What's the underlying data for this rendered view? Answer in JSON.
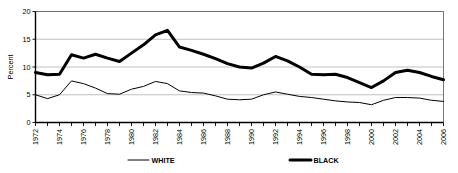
{
  "chart_data": {
    "type": "line",
    "title": "",
    "xlabel": "",
    "ylabel": "Percent",
    "ylim": [
      0,
      20
    ],
    "yticks": [
      0,
      5,
      10,
      15,
      20
    ],
    "xlim": [
      1972,
      2006
    ],
    "grid": true,
    "legend_position": "bottom",
    "x": [
      1972,
      1973,
      1974,
      1975,
      1976,
      1977,
      1978,
      1979,
      1980,
      1981,
      1982,
      1983,
      1984,
      1985,
      1986,
      1987,
      1988,
      1989,
      1990,
      1991,
      1992,
      1993,
      1994,
      1995,
      1996,
      1997,
      1998,
      1999,
      2000,
      2001,
      2002,
      2003,
      2004,
      2005,
      2006
    ],
    "xtick_labels": [
      "1972",
      "1973",
      "1974",
      "1975",
      "1976",
      "1977",
      "1978",
      "1979",
      "1980",
      "1981",
      "1982",
      "1983",
      "1984",
      "1985",
      "1986",
      "1987",
      "1988",
      "1989",
      "1990",
      "1991",
      "1992",
      "1993",
      "1994",
      "1995",
      "1996",
      "1997",
      "1998",
      "1999",
      "2000",
      "2001",
      "2002",
      "2003",
      "2004",
      "2005",
      "2006"
    ],
    "xtick_labels_shown": [
      "1972",
      "1974",
      "1976",
      "1978",
      "1980",
      "1982",
      "1984",
      "1986",
      "1988",
      "1990",
      "1992",
      "1994",
      "1996",
      "1998",
      "2000",
      "2002",
      "2004",
      "2006"
    ],
    "series": [
      {
        "name": "WHITE",
        "style": "thin",
        "color": "#000000",
        "values": [
          5.0,
          4.3,
          5.0,
          7.5,
          7.0,
          6.2,
          5.2,
          5.1,
          6.0,
          6.5,
          7.4,
          7.0,
          5.7,
          5.4,
          5.3,
          4.8,
          4.2,
          4.1,
          4.2,
          5.0,
          5.5,
          5.1,
          4.7,
          4.5,
          4.2,
          3.9,
          3.7,
          3.6,
          3.2,
          4.0,
          4.5,
          4.5,
          4.4,
          4.0,
          3.8
        ]
      },
      {
        "name": "BLACK",
        "style": "thick",
        "color": "#000000",
        "values": [
          9.0,
          8.6,
          8.7,
          12.2,
          11.6,
          12.3,
          11.6,
          11.0,
          12.5,
          14.0,
          15.8,
          16.6,
          13.6,
          13.0,
          12.3,
          11.5,
          10.6,
          10.0,
          9.8,
          10.7,
          11.9,
          11.1,
          10.0,
          8.7,
          8.6,
          8.7,
          8.1,
          7.2,
          6.3,
          7.5,
          9.0,
          9.4,
          9.0,
          8.3,
          7.7
        ]
      }
    ],
    "legend": [
      {
        "label": "WHITE",
        "style": "thin"
      },
      {
        "label": "BLACK",
        "style": "thick"
      }
    ]
  }
}
